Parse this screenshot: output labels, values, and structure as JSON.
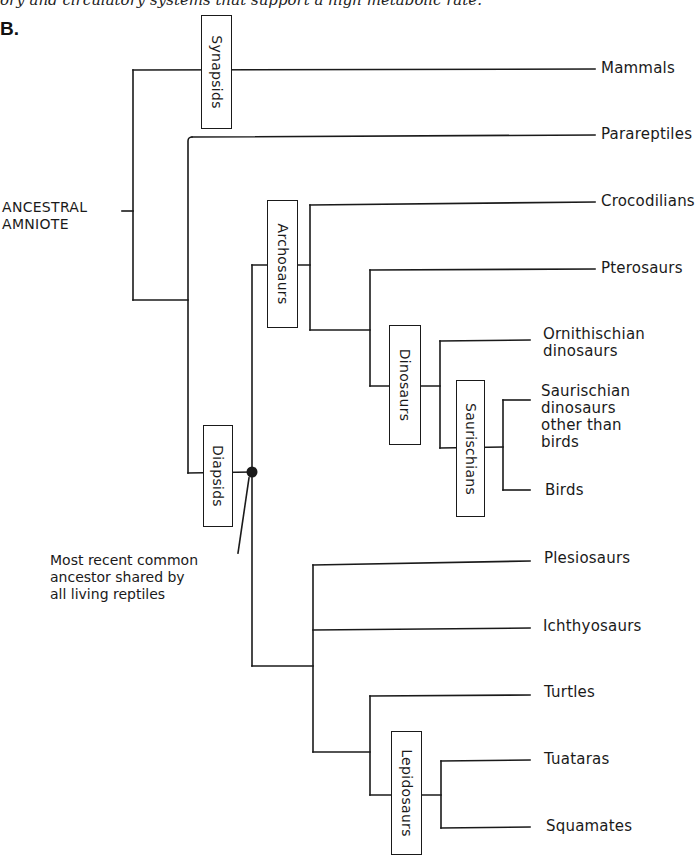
{
  "header": {
    "cut_off_caption": "ory and circulatory systems that support a high metabolic rate.",
    "figure_number": "B."
  },
  "root": {
    "line1": "ANCESTRAL",
    "line2": "AMNIOTE"
  },
  "clades": {
    "synapsids": "Synapsids",
    "diapsids": "Diapsids",
    "archosaurs": "Archosaurs",
    "dinosaurs": "Dinosaurs",
    "saurischians": "Saurischians",
    "lepidosaurs": "Lepidosaurs"
  },
  "taxa": {
    "mammals": "Mammals",
    "parareptiles": "Parareptiles",
    "crocodilians": "Crocodilians",
    "pterosaurs": "Pterosaurs",
    "ornithischian_1": "Ornithischian",
    "ornithischian_2": "dinosaurs",
    "saurischian_1": "Saurischian",
    "saurischian_2": "dinosaurs",
    "saurischian_3": "other than",
    "saurischian_4": "birds",
    "birds": "Birds",
    "plesiosaurs": "Plesiosaurs",
    "ichthyosaurs": "Ichthyosaurs",
    "turtles": "Turtles",
    "tuataras": "Tuataras",
    "squamates": "Squamates"
  },
  "annotation": {
    "line1": "Most recent common",
    "line2": "ancestor shared by",
    "line3": "all living reptiles"
  },
  "colors": {
    "ink": "#1a1a1a",
    "background": "#ffffff"
  }
}
